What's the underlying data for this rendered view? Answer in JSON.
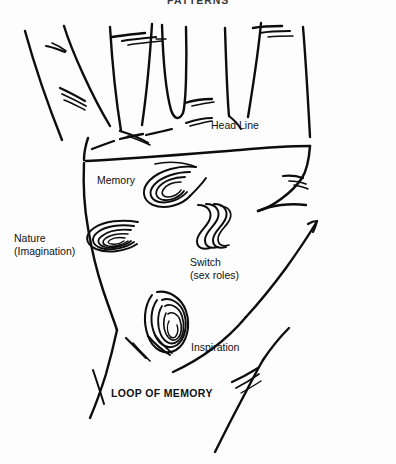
{
  "figure": {
    "title": "PATTERNS"
  },
  "labels": {
    "head_line": "Head Line",
    "memory": "Memory",
    "nature": "Nature",
    "nature_sub": "(Imagination)",
    "switch": "Switch",
    "switch_sub": "(sex roles)",
    "inspiration": "Inspiration",
    "loop_of_memory": "LOOP OF MEMORY"
  },
  "colors": {
    "background": "#fdfdfd",
    "ink": "#0d0d0d",
    "text": "#111111",
    "title_text": "#3a3a3a"
  },
  "markings": [
    {
      "name": "memory-whorl",
      "kind": "tilted-horizontal-spiral",
      "label": "Memory",
      "center_x": 166,
      "center_y": 189
    },
    {
      "name": "nature-loop",
      "kind": "nested-horizontal-loops",
      "label": "Nature (Imagination)",
      "center_x": 107,
      "center_y": 240
    },
    {
      "name": "switch-wave",
      "kind": "parallel-s-curves",
      "label": "Switch (sex roles)",
      "center_x": 212,
      "center_y": 224
    },
    {
      "name": "inspiration-loop",
      "kind": "nested-vertical-loops",
      "label": "Inspiration",
      "center_x": 168,
      "center_y": 318
    }
  ],
  "hand": {
    "fingers": 4,
    "major_line": "Head Line",
    "view": "left-palm-open"
  }
}
